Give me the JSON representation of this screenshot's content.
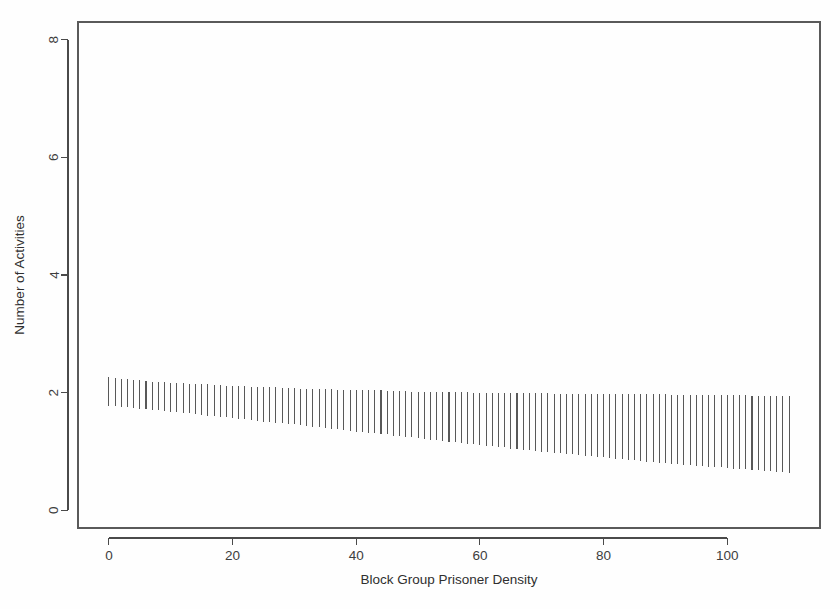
{
  "figure": {
    "background_color": "#fefefe",
    "plot_area": {
      "left": 78,
      "right": 820,
      "top": 22,
      "bottom": 528
    },
    "frame_color": "#5a5a5a",
    "series_color": "#585858"
  },
  "chart_data": {
    "type": "line",
    "title": "",
    "subtitle": "",
    "xlabel": "Block Group Prisoner Density",
    "ylabel": "Number of Activities",
    "xlim": [
      -5,
      115
    ],
    "ylim": [
      -0.3,
      8.3
    ],
    "xticks": [
      0,
      20,
      40,
      60,
      80,
      100
    ],
    "xtick_labels": [
      "0",
      "20",
      "40",
      "60",
      "80",
      "100"
    ],
    "yticks": [
      0,
      2,
      4,
      6,
      8
    ],
    "ytick_labels": [
      "0",
      "2",
      "4",
      "6",
      "8"
    ],
    "grid": false,
    "legend": null,
    "annotations": [],
    "x": [
      0,
      1,
      2,
      3,
      4,
      5,
      6,
      7,
      8,
      9,
      10,
      11,
      12,
      13,
      14,
      15,
      16,
      17,
      18,
      19,
      20,
      21,
      22,
      23,
      24,
      25,
      26,
      27,
      28,
      29,
      30,
      31,
      32,
      33,
      34,
      35,
      36,
      37,
      38,
      39,
      40,
      41,
      42,
      43,
      44,
      45,
      46,
      47,
      48,
      49,
      50,
      51,
      52,
      53,
      54,
      55,
      56,
      57,
      58,
      59,
      60,
      61,
      62,
      63,
      64,
      65,
      66,
      67,
      68,
      69,
      70,
      71,
      72,
      73,
      74,
      75,
      76,
      77,
      78,
      79,
      80,
      81,
      82,
      83,
      84,
      85,
      86,
      87,
      88,
      89,
      90,
      91,
      92,
      93,
      94,
      95,
      96,
      97,
      98,
      99,
      100,
      101,
      102,
      103,
      104,
      105,
      106,
      107,
      108,
      109,
      110
    ],
    "series": [
      {
        "name": "Upper confidence bound",
        "values": [
          2.26,
          2.25,
          2.24,
          2.23,
          2.22,
          2.21,
          2.2,
          2.19,
          2.18,
          2.18,
          2.17,
          2.16,
          2.16,
          2.15,
          2.15,
          2.14,
          2.14,
          2.13,
          2.13,
          2.12,
          2.12,
          2.11,
          2.11,
          2.1,
          2.1,
          2.09,
          2.09,
          2.09,
          2.08,
          2.08,
          2.08,
          2.07,
          2.07,
          2.07,
          2.06,
          2.06,
          2.06,
          2.05,
          2.05,
          2.05,
          2.05,
          2.04,
          2.04,
          2.04,
          2.04,
          2.03,
          2.03,
          2.03,
          2.03,
          2.02,
          2.02,
          2.02,
          2.02,
          2.02,
          2.01,
          2.01,
          2.01,
          2.01,
          2.01,
          2.0,
          2.0,
          2.0,
          2.0,
          2.0,
          2.0,
          1.99,
          1.99,
          1.99,
          1.99,
          1.99,
          1.99,
          1.99,
          1.98,
          1.98,
          1.98,
          1.98,
          1.98,
          1.98,
          1.98,
          1.98,
          1.98,
          1.97,
          1.97,
          1.97,
          1.97,
          1.97,
          1.97,
          1.97,
          1.97,
          1.97,
          1.97,
          1.96,
          1.96,
          1.96,
          1.96,
          1.96,
          1.96,
          1.96,
          1.96,
          1.96,
          1.96,
          1.96,
          1.96,
          1.96,
          1.95,
          1.95,
          1.95,
          1.95,
          1.95,
          1.95,
          1.95
        ]
      },
      {
        "name": "Lower confidence bound",
        "values": [
          1.78,
          1.77,
          1.76,
          1.75,
          1.74,
          1.73,
          1.72,
          1.71,
          1.7,
          1.69,
          1.68,
          1.67,
          1.66,
          1.65,
          1.64,
          1.62,
          1.61,
          1.6,
          1.59,
          1.58,
          1.57,
          1.56,
          1.55,
          1.54,
          1.52,
          1.51,
          1.5,
          1.49,
          1.48,
          1.47,
          1.46,
          1.45,
          1.43,
          1.42,
          1.41,
          1.4,
          1.39,
          1.38,
          1.37,
          1.35,
          1.34,
          1.33,
          1.32,
          1.31,
          1.3,
          1.29,
          1.27,
          1.26,
          1.25,
          1.24,
          1.23,
          1.22,
          1.2,
          1.19,
          1.18,
          1.17,
          1.16,
          1.15,
          1.13,
          1.12,
          1.11,
          1.1,
          1.09,
          1.08,
          1.07,
          1.05,
          1.04,
          1.03,
          1.02,
          1.01,
          1.0,
          0.99,
          0.98,
          0.97,
          0.96,
          0.95,
          0.94,
          0.93,
          0.92,
          0.91,
          0.9,
          0.89,
          0.88,
          0.87,
          0.86,
          0.85,
          0.84,
          0.83,
          0.82,
          0.81,
          0.8,
          0.79,
          0.78,
          0.77,
          0.77,
          0.76,
          0.75,
          0.74,
          0.73,
          0.73,
          0.72,
          0.71,
          0.7,
          0.7,
          0.69,
          0.68,
          0.67,
          0.67,
          0.66,
          0.65,
          0.64
        ]
      }
    ]
  }
}
